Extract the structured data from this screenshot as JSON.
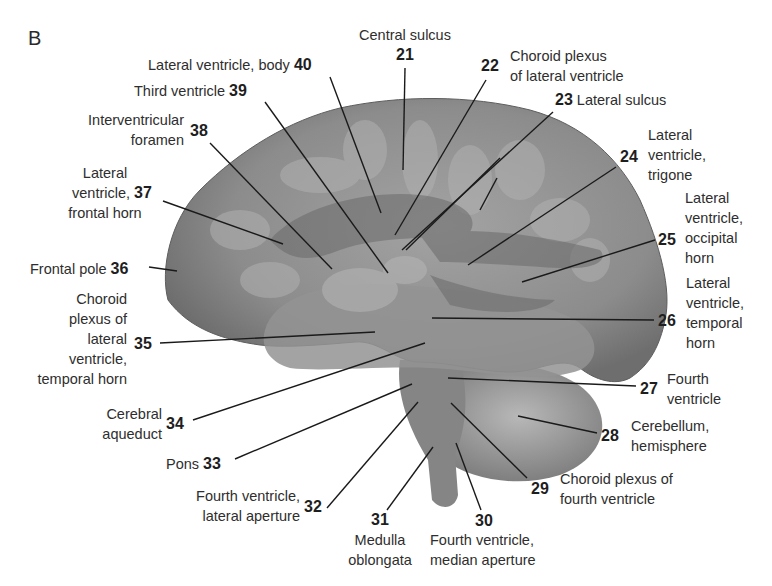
{
  "figure": {
    "panel_label": "B",
    "colors": {
      "background": "#ffffff",
      "cortex": "#8a8a8a",
      "cortex_light": "#b5b5b5",
      "ventricle": "#6f6f6f",
      "cerebellum": "#939393",
      "text": "#2e2e2e",
      "leader": "#1a1a1a"
    },
    "labels": [
      {
        "num": "21",
        "text": [
          "Central sulcus"
        ]
      },
      {
        "num": "22",
        "text": [
          "Choroid plexus",
          "of lateral ventricle"
        ]
      },
      {
        "num": "23",
        "text": [
          "Lateral sulcus"
        ]
      },
      {
        "num": "24",
        "text": [
          "Lateral",
          "ventricle,",
          "trigone"
        ]
      },
      {
        "num": "25",
        "text": [
          "Lateral",
          "ventricle,",
          "occipital",
          "horn"
        ]
      },
      {
        "num": "26",
        "text": [
          "Lateral",
          "ventricle,",
          "temporal",
          "horn"
        ]
      },
      {
        "num": "27",
        "text": [
          "Fourth",
          "ventricle"
        ]
      },
      {
        "num": "28",
        "text": [
          "Cerebellum,",
          "hemisphere"
        ]
      },
      {
        "num": "29",
        "text": [
          "Choroid plexus of",
          "fourth ventricle"
        ]
      },
      {
        "num": "30",
        "text": [
          "Fourth ventricle,",
          "median aperture"
        ]
      },
      {
        "num": "31",
        "text": [
          "Medulla",
          "oblongata"
        ]
      },
      {
        "num": "32",
        "text": [
          "Fourth ventricle,",
          "lateral aperture"
        ]
      },
      {
        "num": "33",
        "text": [
          "Pons"
        ]
      },
      {
        "num": "34",
        "text": [
          "Cerebral",
          "aqueduct"
        ]
      },
      {
        "num": "35",
        "text": [
          "Choroid",
          "plexus of",
          "lateral",
          "ventricle,",
          "temporal horn"
        ]
      },
      {
        "num": "36",
        "text": [
          "Frontal pole"
        ]
      },
      {
        "num": "37",
        "text": [
          "Lateral",
          "ventricle,",
          "frontal horn"
        ]
      },
      {
        "num": "38",
        "text": [
          "Interventricular",
          "foramen"
        ]
      },
      {
        "num": "39",
        "text": [
          "Third ventricle"
        ]
      },
      {
        "num": "40",
        "text": [
          "Lateral ventricle, body"
        ]
      }
    ]
  }
}
